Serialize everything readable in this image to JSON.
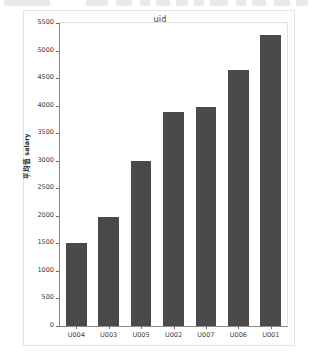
{
  "toolbar": {
    "visible_fragment": true
  },
  "chart_card": {
    "title": "uid"
  },
  "chart_data": {
    "type": "bar",
    "title": "uid",
    "xlabel": "",
    "ylabel": "平均值 salary",
    "categories": [
      "U004",
      "U003",
      "U005",
      "U002",
      "U007",
      "U006",
      "U001"
    ],
    "values": [
      1500,
      1980,
      3000,
      3880,
      3980,
      4650,
      5280
    ],
    "ylim": [
      0,
      5500
    ],
    "ytick_labels": [
      "0",
      "500",
      "1000",
      "1500",
      "2000",
      "2500",
      "3000",
      "3500",
      "4000",
      "4500",
      "5000",
      "5500"
    ],
    "ytick_values": [
      0,
      500,
      1000,
      1500,
      2000,
      2500,
      3000,
      3500,
      4000,
      4500,
      5000,
      5500
    ],
    "grid": false,
    "legend": "none",
    "bar_color": "#4a4a4a",
    "axis_color": "#8a8a8a",
    "background_color": "#ffffff"
  }
}
